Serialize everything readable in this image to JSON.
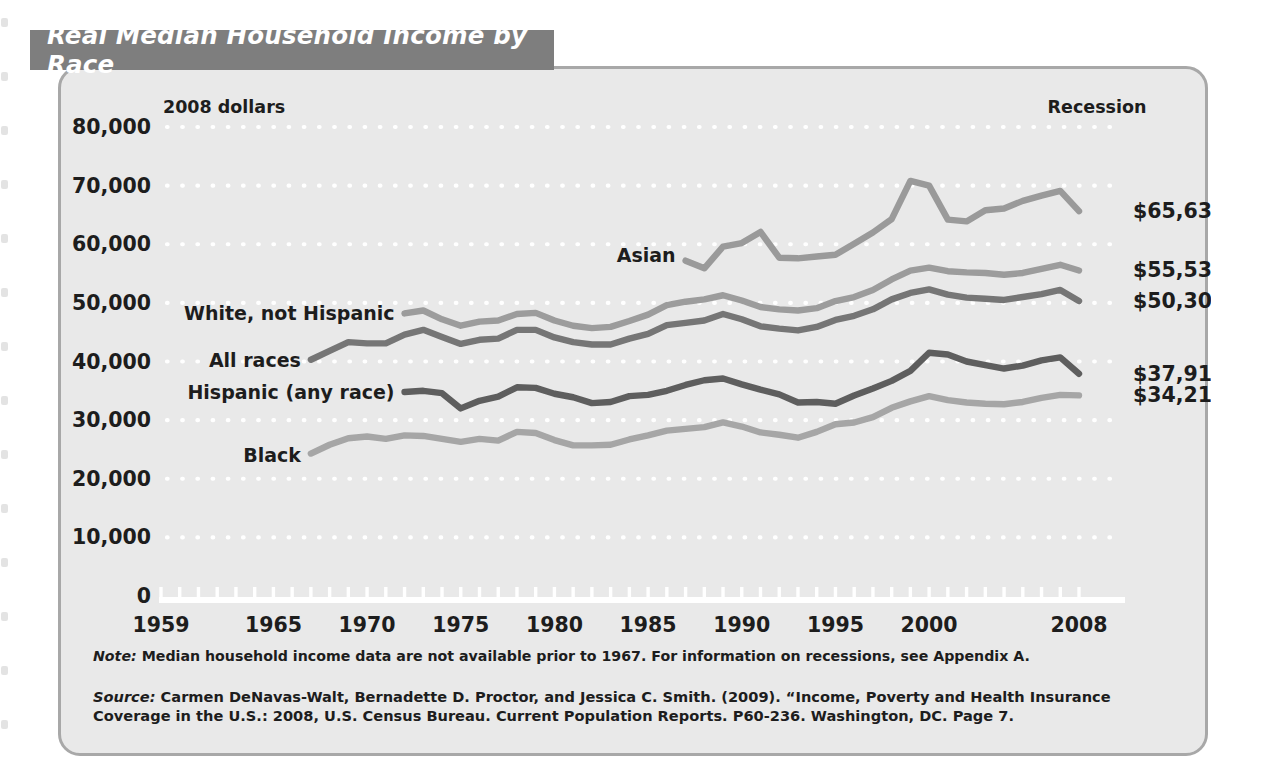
{
  "title": "Real Median Household Income by Race",
  "axis": {
    "y_unit_label": "2008 dollars",
    "recession_label": "Recession",
    "y_ticks": [
      "80,000",
      "70,000",
      "60,000",
      "50,000",
      "40,000",
      "30,000",
      "20,000",
      "10,000",
      "0"
    ],
    "x_ticks": [
      "1959",
      "1965",
      "1970",
      "1975",
      "1980",
      "1985",
      "1990",
      "1995",
      "2000",
      "2008"
    ]
  },
  "end_values": {
    "asian": "$65,637",
    "white_not_hispanic": "$55,530",
    "all_races": "$50,303",
    "hispanic": "$37,913",
    "black": "$34,218"
  },
  "series_labels": {
    "white_not_hispanic": "White, not Hispanic",
    "all_races": "All races",
    "hispanic": "Hispanic (any race)",
    "black": "Black",
    "asian": "Asian"
  },
  "footnotes": {
    "note_label": "Note:",
    "note_text": " Median household income data are not available prior to 1967. For information on recessions, see Appendix A.",
    "source_label": "Source:",
    "source_text": " Carmen DeNavas-Walt, Bernadette D. Proctor, and Jessica C. Smith. (2009). “Income, Poverty and Health Insurance Coverage in the U.S.:  2008, U.S. Census Bureau. Current Population Reports. P60-236. Washington, DC. Page 7."
  },
  "colors": {
    "title_tab_bg": "#7e7e7e",
    "panel_bg": "#e9e9e9",
    "panel_border": "#a8a8a8",
    "gridline": "#ffffff",
    "axis": "#ffffff",
    "text": "#1d1d1d",
    "asian": "#9a9a9a",
    "white_not_hispanic": "#9c9c9c",
    "all_races": "#767676",
    "hispanic": "#5e5e5e",
    "black": "#a6a6a6"
  },
  "chart_data": {
    "type": "line",
    "title": "Real Median Household Income by Race",
    "xlabel": "",
    "ylabel": "2008 dollars",
    "xlim": [
      1959,
      2008
    ],
    "ylim": [
      0,
      80000
    ],
    "grid": true,
    "legend": "inline-labels",
    "y_tick_values": [
      0,
      10000,
      20000,
      30000,
      40000,
      50000,
      60000,
      70000,
      80000
    ],
    "x_tick_values": [
      1959,
      1965,
      1970,
      1975,
      1980,
      1985,
      1990,
      1995,
      2000,
      2008
    ],
    "series": [
      {
        "name": "Asian",
        "color": "#9a9a9a",
        "end_value": 65637,
        "x": [
          1987,
          1988,
          1989,
          1990,
          1991,
          1992,
          1993,
          1994,
          1995,
          1996,
          1997,
          1998,
          1999,
          2000,
          2001,
          2002,
          2003,
          2004,
          2005,
          2006,
          2007,
          2008
        ],
        "values": [
          57200,
          55900,
          59600,
          60200,
          62100,
          57700,
          57600,
          57900,
          58200,
          60100,
          62000,
          64300,
          70800,
          70000,
          64200,
          63900,
          65800,
          66100,
          67400,
          68300,
          69100,
          65637
        ]
      },
      {
        "name": "White, not Hispanic",
        "color": "#9c9c9c",
        "end_value": 55530,
        "x": [
          1972,
          1973,
          1974,
          1975,
          1976,
          1977,
          1978,
          1979,
          1980,
          1981,
          1982,
          1983,
          1984,
          1985,
          1986,
          1987,
          1988,
          1989,
          1990,
          1991,
          1992,
          1993,
          1994,
          1995,
          1996,
          1997,
          1998,
          1999,
          2000,
          2001,
          2002,
          2003,
          2004,
          2005,
          2006,
          2007,
          2008
        ],
        "values": [
          48200,
          48700,
          47200,
          46100,
          46800,
          47000,
          48100,
          48300,
          47000,
          46100,
          45700,
          45900,
          46900,
          48000,
          49600,
          50200,
          50600,
          51300,
          50400,
          49300,
          48900,
          48700,
          49100,
          50300,
          51000,
          52200,
          54000,
          55500,
          56000,
          55400,
          55200,
          55100,
          54800,
          55100,
          55800,
          56500,
          55530
        ]
      },
      {
        "name": "All races",
        "color": "#767676",
        "end_value": 50303,
        "x": [
          1967,
          1968,
          1969,
          1970,
          1971,
          1972,
          1973,
          1974,
          1975,
          1976,
          1977,
          1978,
          1979,
          1980,
          1981,
          1982,
          1983,
          1984,
          1985,
          1986,
          1987,
          1988,
          1989,
          1990,
          1991,
          1992,
          1993,
          1994,
          1995,
          1996,
          1997,
          1998,
          1999,
          2000,
          2001,
          2002,
          2003,
          2004,
          2005,
          2006,
          2007,
          2008
        ],
        "values": [
          40300,
          41800,
          43300,
          43100,
          43100,
          44600,
          45400,
          44200,
          43000,
          43700,
          43900,
          45400,
          45400,
          44100,
          43300,
          42900,
          42900,
          43900,
          44700,
          46200,
          46600,
          47000,
          48100,
          47200,
          46000,
          45600,
          45300,
          45900,
          47100,
          47800,
          48900,
          50600,
          51700,
          52300,
          51400,
          50900,
          50700,
          50500,
          51000,
          51500,
          52200,
          50303
        ]
      },
      {
        "name": "Hispanic (any race)",
        "color": "#5e5e5e",
        "end_value": 37913,
        "x": [
          1972,
          1973,
          1974,
          1975,
          1976,
          1977,
          1978,
          1979,
          1980,
          1981,
          1982,
          1983,
          1984,
          1985,
          1986,
          1987,
          1988,
          1989,
          1990,
          1991,
          1992,
          1993,
          1994,
          1995,
          1996,
          1997,
          1998,
          1999,
          2000,
          2001,
          2002,
          2003,
          2004,
          2005,
          2006,
          2007,
          2008
        ],
        "values": [
          34800,
          35000,
          34600,
          32000,
          33300,
          34000,
          35600,
          35500,
          34500,
          33900,
          32900,
          33100,
          34100,
          34300,
          35000,
          36000,
          36800,
          37100,
          36100,
          35200,
          34400,
          33000,
          33100,
          32800,
          34200,
          35400,
          36700,
          38400,
          41500,
          41200,
          40000,
          39400,
          38800,
          39300,
          40200,
          40700,
          37913
        ]
      },
      {
        "name": "Black",
        "color": "#a6a6a6",
        "end_value": 34218,
        "x": [
          1967,
          1968,
          1969,
          1970,
          1971,
          1972,
          1973,
          1974,
          1975,
          1976,
          1977,
          1978,
          1979,
          1980,
          1981,
          1982,
          1983,
          1984,
          1985,
          1986,
          1987,
          1988,
          1989,
          1990,
          1991,
          1992,
          1993,
          1994,
          1995,
          1996,
          1997,
          1998,
          1999,
          2000,
          2001,
          2002,
          2003,
          2004,
          2005,
          2006,
          2007,
          2008
        ],
        "values": [
          24300,
          25800,
          26900,
          27200,
          26800,
          27400,
          27300,
          26800,
          26300,
          26800,
          26500,
          28000,
          27800,
          26600,
          25700,
          25700,
          25800,
          26700,
          27400,
          28200,
          28500,
          28800,
          29600,
          28900,
          27900,
          27500,
          27000,
          28000,
          29300,
          29600,
          30500,
          32100,
          33200,
          34100,
          33400,
          33000,
          32800,
          32700,
          33100,
          33800,
          34300,
          34218
        ]
      }
    ]
  }
}
